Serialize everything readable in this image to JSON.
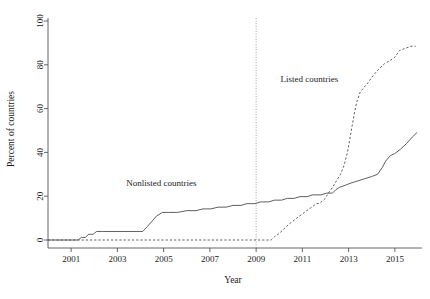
{
  "chart_data": {
    "type": "line",
    "title": "",
    "subtitle": "",
    "xlabel": "Year",
    "ylabel": "Percent of countries",
    "xlim": [
      2000.0,
      2016.0
    ],
    "ylim": [
      0,
      100
    ],
    "xticks": [
      2001,
      2003,
      2005,
      2007,
      2009,
      2011,
      2013,
      2015
    ],
    "xticklabels": [
      "2001",
      "2003",
      "2005",
      "2007",
      "2009",
      "2011",
      "2013",
      "2015"
    ],
    "yticks": [
      0,
      20,
      40,
      60,
      80,
      100
    ],
    "yticklabels": [
      "0",
      "20",
      "40",
      "60",
      "80",
      "100"
    ],
    "grid": false,
    "legend": "inline-annotations",
    "annotations": [
      {
        "name": "nonlisted-label",
        "text": "Nonlisted countries",
        "x": 2004.9,
        "y": 24.5
      },
      {
        "name": "listed-label",
        "text": "Listed countries",
        "x": 2011.3,
        "y": 72.0
      }
    ],
    "reference_lines": [
      {
        "name": "year-2009-marker",
        "orientation": "vertical",
        "x": 2009.0,
        "style": "dotted"
      }
    ],
    "series": [
      {
        "name": "Nonlisted countries",
        "style": "solid",
        "color": "#4d4d4d",
        "points": [
          [
            2000.0,
            0.0
          ],
          [
            2001.3,
            0.0
          ],
          [
            2001.45,
            1.2
          ],
          [
            2001.62,
            1.2
          ],
          [
            2001.75,
            2.6
          ],
          [
            2001.95,
            2.6
          ],
          [
            2002.1,
            3.9
          ],
          [
            2002.35,
            3.9
          ],
          [
            2004.1,
            3.9
          ],
          [
            2004.3,
            6.2
          ],
          [
            2004.5,
            8.6
          ],
          [
            2004.7,
            11.0
          ],
          [
            2004.95,
            12.6
          ],
          [
            2005.2,
            12.6
          ],
          [
            2005.6,
            12.6
          ],
          [
            2006.0,
            13.4
          ],
          [
            2006.4,
            13.4
          ],
          [
            2006.7,
            14.2
          ],
          [
            2007.05,
            14.2
          ],
          [
            2007.35,
            15.0
          ],
          [
            2007.7,
            15.0
          ],
          [
            2008.0,
            15.8
          ],
          [
            2008.35,
            15.8
          ],
          [
            2008.6,
            16.6
          ],
          [
            2008.95,
            16.6
          ],
          [
            2009.2,
            17.4
          ],
          [
            2009.55,
            17.4
          ],
          [
            2009.8,
            18.2
          ],
          [
            2010.1,
            18.2
          ],
          [
            2010.35,
            19.0
          ],
          [
            2010.65,
            19.0
          ],
          [
            2010.9,
            19.8
          ],
          [
            2011.2,
            19.8
          ],
          [
            2011.45,
            20.6
          ],
          [
            2011.8,
            20.6
          ],
          [
            2012.05,
            21.4
          ],
          [
            2012.3,
            21.4
          ],
          [
            2012.45,
            23.0
          ],
          [
            2012.6,
            24.0
          ],
          [
            2012.85,
            25.0
          ],
          [
            2013.1,
            26.0
          ],
          [
            2013.4,
            27.0
          ],
          [
            2013.7,
            28.0
          ],
          [
            2014.0,
            29.0
          ],
          [
            2014.25,
            30.0
          ],
          [
            2014.45,
            33.0
          ],
          [
            2014.6,
            36.0
          ],
          [
            2014.8,
            38.5
          ],
          [
            2015.0,
            39.5
          ],
          [
            2015.25,
            41.5
          ],
          [
            2015.5,
            44.0
          ],
          [
            2015.75,
            47.0
          ],
          [
            2015.95,
            49.0
          ]
        ]
      },
      {
        "name": "Listed countries",
        "style": "dashed",
        "color": "#4d4d4d",
        "points": [
          [
            2000.0,
            0.0
          ],
          [
            2009.65,
            0.0
          ],
          [
            2009.8,
            1.5
          ],
          [
            2010.0,
            3.0
          ],
          [
            2010.2,
            5.0
          ],
          [
            2010.45,
            7.5
          ],
          [
            2010.7,
            9.5
          ],
          [
            2010.95,
            11.5
          ],
          [
            2011.2,
            13.5
          ],
          [
            2011.4,
            15.0
          ],
          [
            2011.6,
            16.5
          ],
          [
            2011.75,
            16.8
          ],
          [
            2011.95,
            18.5
          ],
          [
            2012.1,
            21.0
          ],
          [
            2012.3,
            24.0
          ],
          [
            2012.5,
            27.5
          ],
          [
            2012.65,
            30.0
          ],
          [
            2012.8,
            34.0
          ],
          [
            2012.95,
            40.0
          ],
          [
            2013.05,
            46.0
          ],
          [
            2013.15,
            52.0
          ],
          [
            2013.25,
            58.0
          ],
          [
            2013.35,
            63.0
          ],
          [
            2013.5,
            67.5
          ],
          [
            2013.65,
            69.5
          ],
          [
            2013.85,
            72.0
          ],
          [
            2014.05,
            75.0
          ],
          [
            2014.3,
            78.0
          ],
          [
            2014.55,
            80.5
          ],
          [
            2014.8,
            82.0
          ],
          [
            2015.0,
            83.5
          ],
          [
            2015.2,
            86.5
          ],
          [
            2015.45,
            87.5
          ],
          [
            2015.7,
            88.5
          ],
          [
            2015.9,
            88.5
          ]
        ]
      }
    ]
  }
}
